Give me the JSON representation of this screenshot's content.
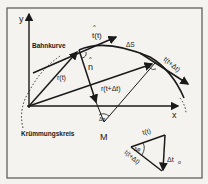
{
  "diagram": {
    "colors": {
      "background": "#f4f3ef",
      "ink": "#1a1a1a",
      "frame": "#555555"
    },
    "axes": {
      "x_label": "x",
      "y_label": "y"
    },
    "labels": {
      "path_curve": "Bahnkurve",
      "curvature_circle": "Krümmungskreis",
      "tangent_t": "t(t)",
      "tangent_t_hat": "^",
      "tangent_t_dt": "t(t+Δt)",
      "arc_length": "ΔS",
      "normal": "n",
      "normal_hat": "^",
      "position_t": "r(t)",
      "position_t_dt": "r(t+Δt)",
      "center": "M",
      "angle": "Δφ",
      "inset_t": "t(t)",
      "inset_t_dt": "t(t+Δt)",
      "inset_delta_t": "Δt",
      "inset_delta_t_sub": "o"
    },
    "points": {
      "origin": [
        29,
        106
      ],
      "p1": [
        79,
        50
      ],
      "p2": [
        155,
        63
      ],
      "center_M": [
        104,
        122
      ]
    }
  }
}
